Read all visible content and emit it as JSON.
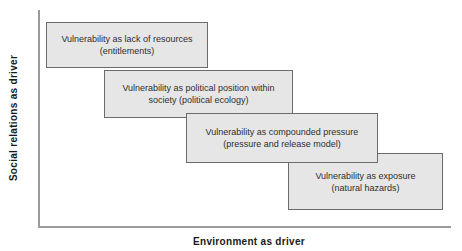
{
  "diagram": {
    "y_axis_label": "Social relations as driver",
    "x_axis_label": "Environment as driver",
    "boxes": [
      {
        "line1": "Vulnerability as lack of resources",
        "line2": "(entitlements)"
      },
      {
        "line1": "Vulnerability as political position within",
        "line2": "society (political ecology)"
      },
      {
        "line1": "Vulnerability as compounded pressure",
        "line2": "(pressure and release model)"
      },
      {
        "line1": "Vulnerability as exposure",
        "line2": "(natural hazards)"
      }
    ],
    "colors": {
      "background": "#ffffff",
      "box_fill": "#e6e6e6",
      "box_border": "#6b6b6b",
      "axis_line": "#9a9a9a",
      "box_text": "#2e2e2e",
      "axis_label_text": "#1a1a1a"
    }
  }
}
